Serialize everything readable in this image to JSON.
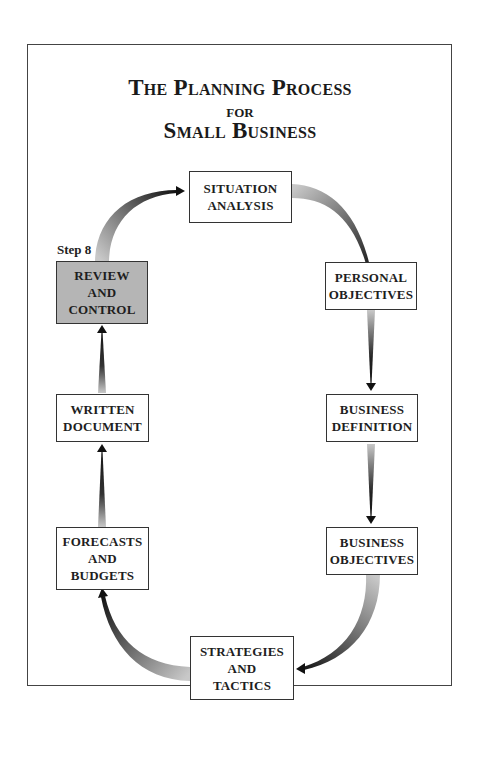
{
  "title": {
    "line1": "The Planning Process",
    "line2": "for",
    "line3": "Small Business"
  },
  "step_label": "Step 8",
  "steps": [
    {
      "id": "situation-analysis",
      "lines": [
        "SITUATION",
        "ANALYSIS"
      ],
      "highlighted": false
    },
    {
      "id": "personal-objectives",
      "lines": [
        "PERSONAL",
        "OBJECTIVES"
      ],
      "highlighted": false
    },
    {
      "id": "business-definition",
      "lines": [
        "BUSINESS",
        "DEFINITION"
      ],
      "highlighted": false
    },
    {
      "id": "business-objectives",
      "lines": [
        "BUSINESS",
        "OBJECTIVES"
      ],
      "highlighted": false
    },
    {
      "id": "strategies-and-tactics",
      "lines": [
        "STRATEGIES",
        "AND",
        "TACTICS"
      ],
      "highlighted": false
    },
    {
      "id": "forecasts-and-budgets",
      "lines": [
        "FORECASTS",
        "AND",
        "BUDGETS"
      ],
      "highlighted": false
    },
    {
      "id": "written-document",
      "lines": [
        "WRITTEN",
        "DOCUMENT"
      ],
      "highlighted": false
    },
    {
      "id": "review-and-control",
      "lines": [
        "REVIEW",
        "AND",
        "CONTROL"
      ],
      "highlighted": true
    }
  ],
  "flow": [
    "SITUATION ANALYSIS -> PERSONAL OBJECTIVES",
    "PERSONAL OBJECTIVES -> BUSINESS DEFINITION",
    "BUSINESS DEFINITION -> BUSINESS OBJECTIVES",
    "BUSINESS OBJECTIVES -> STRATEGIES AND TACTICS",
    "STRATEGIES AND TACTICS -> FORECASTS AND BUDGETS",
    "FORECASTS AND BUDGETS -> WRITTEN DOCUMENT",
    "WRITTEN DOCUMENT -> REVIEW AND CONTROL",
    "REVIEW AND CONTROL -> SITUATION ANALYSIS"
  ],
  "colors": {
    "highlight_fill": "#b5b5b5",
    "box_border": "#333333",
    "arrow_dark": "#111111",
    "arrow_light": "#bdbdbd"
  }
}
